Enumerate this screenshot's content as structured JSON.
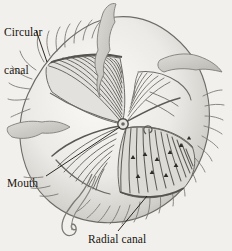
{
  "figure": {
    "style": "grayscale-line-drawing",
    "background_color": "#f2f0ec",
    "ink_color": "#4b4b4b",
    "wash_color": "#d5d4d0",
    "text_color": "#17140f"
  },
  "labels": {
    "circular_canal": {
      "line1": "Circular",
      "line2": "canal"
    },
    "mouth": {
      "text": "Mouth"
    },
    "radial_canal": {
      "text": "Radial canal"
    }
  },
  "leader_lines": [
    {
      "name": "circular-canal-leader",
      "from": [
        36,
        30
      ],
      "to": [
        47,
        63
      ]
    },
    {
      "name": "mouth-leader",
      "from": [
        46,
        176
      ],
      "to": [
        120,
        127
      ]
    },
    {
      "name": "radial-canal-leader",
      "from": [
        118,
        231
      ],
      "to": [
        147,
        196
      ]
    }
  ],
  "anatomy": {
    "bell_center": [
      120,
      126
    ],
    "manubrium_ring": {
      "cx": 123,
      "cy": 124,
      "r": 5
    },
    "quadrants": [
      {
        "name": "upper-left-gonad-fan",
        "radial_count": 14
      },
      {
        "name": "lower-right-gonad-fan",
        "radial_count": 16
      },
      {
        "name": "lower-left-fan",
        "radial_count": 9
      },
      {
        "name": "upper-right-fan",
        "radial_count": 7
      }
    ]
  }
}
